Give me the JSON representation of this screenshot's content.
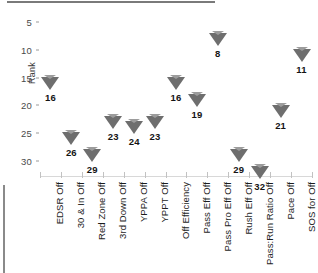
{
  "chart_data": {
    "type": "scatter",
    "title": "",
    "xlabel": "",
    "ylabel": "Rank",
    "ylim": [
      32.8,
      3.5
    ],
    "y_inverted": true,
    "grid": false,
    "legend": null,
    "yticks": [
      5,
      10,
      15,
      20,
      25,
      30
    ],
    "marker": "inverted-triangle",
    "marker_color": "#6e6e6e",
    "categories": [
      "EDSR Off",
      "30 & In Off",
      "Red Zone Off",
      "3rd Down Off",
      "YPPA Off",
      "YPPT Off",
      "Off Efficiency",
      "Pass Eff Off",
      "Pass Pro Eff Off",
      "Rush Eff Off",
      "Pass:Run Ratio Off",
      "Pace Off",
      "SOS for Off"
    ],
    "values": [
      16,
      26,
      29,
      23,
      24,
      23,
      16,
      19,
      8,
      29,
      32,
      21,
      11
    ],
    "point_labels": [
      "16",
      "26",
      "29",
      "23",
      "24",
      "23",
      "16",
      "19",
      "8",
      "29",
      "32",
      "21",
      "11"
    ]
  },
  "axis": {
    "y_title": "Rank",
    "y_tick_labels": [
      "5",
      "10",
      "15",
      "20",
      "25",
      "30"
    ]
  }
}
